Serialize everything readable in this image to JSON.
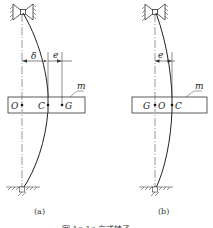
{
  "figure": {
    "caption": "图 10-16   立式转子",
    "colors": {
      "line": "#333333",
      "hatch": "#555555",
      "background": "#ffffff"
    },
    "panels": [
      {
        "id": "a",
        "label": "(a)",
        "points": [
          {
            "name": "O"
          },
          {
            "name": "C"
          },
          {
            "name": "G"
          }
        ],
        "dimensions": {
          "deflection": "δ",
          "eccentricity": "e"
        },
        "mass_label": "m"
      },
      {
        "id": "b",
        "label": "(b)",
        "points": [
          {
            "name": "G"
          },
          {
            "name": "O"
          },
          {
            "name": "C"
          }
        ],
        "dimensions": {
          "eccentricity": "e"
        },
        "mass_label": "m"
      }
    ]
  }
}
